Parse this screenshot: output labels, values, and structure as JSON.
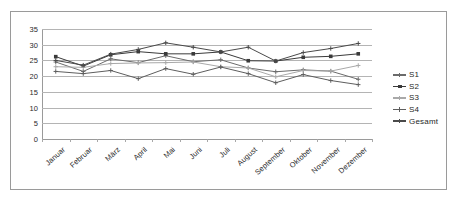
{
  "chart_data": {
    "type": "line",
    "title": "",
    "xlabel": "",
    "ylabel": "",
    "grid": true,
    "legend_position": "right",
    "ylim": [
      0,
      35
    ],
    "yticks": [
      0,
      5,
      10,
      15,
      20,
      25,
      30,
      35
    ],
    "categories": [
      "Januar",
      "Februar",
      "März",
      "April",
      "Mai",
      "Juni",
      "Juli",
      "August",
      "September",
      "Oktober",
      "November",
      "Dezember"
    ],
    "series": [
      {
        "name": "S1",
        "color": "#6b6b6b",
        "marker": "plus",
        "values": [
          24.5,
          21.5,
          25.5,
          24.3,
          26.5,
          24.6,
          25.2,
          22.6,
          21.4,
          22.0,
          21.6,
          19.0
        ]
      },
      {
        "name": "S2",
        "color": "#3a3a3a",
        "marker": "square",
        "values": [
          26.2,
          23.2,
          26.8,
          27.8,
          27.1,
          27.1,
          27.7,
          24.9,
          24.8,
          26.0,
          26.3,
          27.1
        ]
      },
      {
        "name": "S3",
        "color": "#a9a9a9",
        "marker": "plus",
        "values": [
          23.0,
          22.8,
          24.0,
          24.2,
          24.3,
          24.5,
          23.0,
          22.6,
          19.8,
          21.8,
          21.6,
          23.4
        ]
      },
      {
        "name": "S4",
        "color": "#5e5e5e",
        "marker": "plus",
        "values": [
          21.5,
          20.8,
          21.8,
          19.2,
          22.4,
          20.6,
          22.9,
          20.8,
          17.9,
          20.5,
          18.6,
          17.3
        ]
      },
      {
        "name": "Gesamt",
        "color": "#4a4a4a",
        "marker": "plus",
        "values": [
          25.0,
          23.5,
          27.0,
          28.5,
          30.6,
          29.2,
          27.7,
          29.2,
          24.8,
          27.5,
          28.8,
          30.4
        ]
      }
    ]
  },
  "legend": {
    "items": [
      {
        "label": "S1"
      },
      {
        "label": "S2"
      },
      {
        "label": "S3"
      },
      {
        "label": "S4"
      },
      {
        "label": "Gesamt"
      }
    ]
  }
}
